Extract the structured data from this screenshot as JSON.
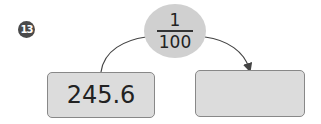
{
  "problem": {
    "number": "13",
    "operator": {
      "numerator": "1",
      "denominator": "100"
    },
    "input_value": "245.6",
    "output_value": ""
  },
  "colors": {
    "badge": "#4a4a4a",
    "ellipse": "#d0d0d0",
    "box": "#dcdcdc",
    "line": "#444444"
  }
}
